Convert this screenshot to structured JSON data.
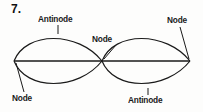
{
  "figure": {
    "number": "7.",
    "stroke_color": "#1a1a1a",
    "background_color": "#fdfdfc",
    "labels": {
      "antinode_top": "Antinode",
      "node_center": "Node",
      "node_right": "Node",
      "node_bottom_left": "Node",
      "antinode_bottom": "Antinode"
    },
    "geometry": {
      "axis_y": 61,
      "left_vertex_x": 14,
      "center_vertex_x": 102,
      "right_vertex_x": 190,
      "crest_y": 33,
      "trough_y": 89
    }
  }
}
